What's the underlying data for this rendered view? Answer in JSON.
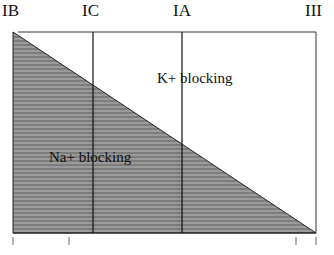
{
  "diagram": {
    "type": "antiarrhythmic-class-spectrum",
    "class_labels": [
      {
        "id": "IB",
        "label": "IB"
      },
      {
        "id": "IC",
        "label": "IC"
      },
      {
        "id": "IA",
        "label": "IA"
      },
      {
        "id": "III",
        "label": "III"
      }
    ],
    "regions": {
      "lower": {
        "label": "Na+ blocking",
        "fill": "#8a8a8a"
      },
      "upper": {
        "label": "K+ blocking",
        "fill": "#ffffff"
      }
    },
    "colors": {
      "line": "#222222",
      "hatch_dark": "#7a7a7a",
      "hatch_light": "#a0a0a0",
      "tick": "#555555"
    }
  }
}
